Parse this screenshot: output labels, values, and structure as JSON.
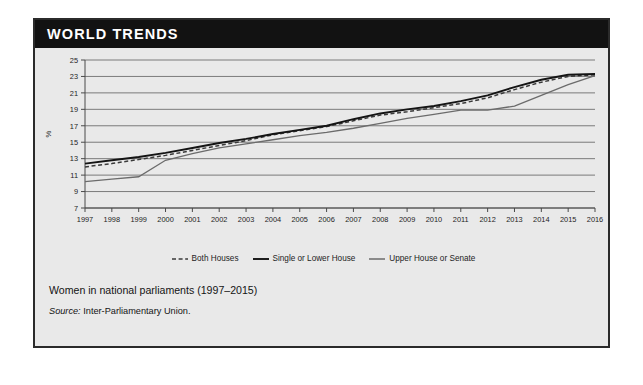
{
  "banner": {
    "title": "WORLD TRENDS"
  },
  "caption": {
    "title": "Women in national parliaments (1997–2015)",
    "source_label": "Source:",
    "source_value": " Inter-Parliamentary Union."
  },
  "legend": {
    "items": [
      {
        "label": "Both Houses",
        "style": "dashed",
        "color": "#3a3a3a"
      },
      {
        "label": "Single or Lower House",
        "style": "solid",
        "color": "#141414"
      },
      {
        "label": "Upper House or Senate",
        "style": "solid",
        "color": "#6b6b6b"
      }
    ]
  },
  "colors": {
    "banner_background": "#121212",
    "banner_text": "#ffffff",
    "card_background": "#e9e9e9",
    "card_border": "#2b2b2b",
    "grid": "#6e6e6e",
    "both_houses": "#3a3a3a",
    "single_or_lower_house": "#141414",
    "upper_house_or_senate": "#6b6b6b"
  },
  "chart_data": {
    "type": "line",
    "title": "Women in national parliaments (1997–2015)",
    "xlabel": "",
    "ylabel": "%",
    "ylim": [
      7,
      25
    ],
    "yticks": [
      7,
      9,
      11,
      13,
      15,
      17,
      19,
      21,
      23,
      25
    ],
    "grid": true,
    "legend_position": "bottom",
    "x": [
      1997,
      1998,
      1999,
      2000,
      2001,
      2002,
      2003,
      2004,
      2005,
      2006,
      2007,
      2008,
      2009,
      2010,
      2011,
      2012,
      2013,
      2014,
      2015,
      2016
    ],
    "categories": [
      "1997",
      "1998",
      "1999",
      "2000",
      "2001",
      "2002",
      "2003",
      "2004",
      "2005",
      "2006",
      "2007",
      "2008",
      "2009",
      "2010",
      "2011",
      "2012",
      "2013",
      "2014",
      "2015",
      "2016"
    ],
    "series": [
      {
        "name": "Both Houses",
        "values": [
          12.0,
          12.4,
          12.9,
          13.4,
          14.0,
          14.6,
          15.2,
          15.9,
          16.4,
          16.9,
          17.6,
          18.3,
          18.7,
          19.2,
          19.7,
          20.4,
          21.4,
          22.3,
          23.0,
          23.2
        ]
      },
      {
        "name": "Single or Lower House",
        "values": [
          12.4,
          12.8,
          13.2,
          13.7,
          14.3,
          14.9,
          15.4,
          16.0,
          16.5,
          17.0,
          17.8,
          18.5,
          19.0,
          19.4,
          20.0,
          20.7,
          21.7,
          22.6,
          23.2,
          23.3
        ]
      },
      {
        "name": "Upper House or Senate",
        "values": [
          10.2,
          10.5,
          10.8,
          12.8,
          13.6,
          14.3,
          14.8,
          15.3,
          15.8,
          16.2,
          16.7,
          17.3,
          17.9,
          18.4,
          18.9,
          18.9,
          19.4,
          20.7,
          22.0,
          23.1
        ]
      }
    ]
  }
}
